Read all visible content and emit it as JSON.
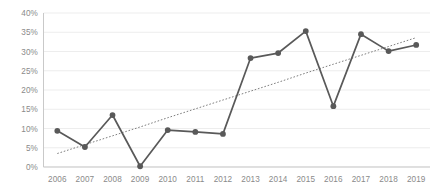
{
  "chart_data": {
    "type": "line",
    "title": "",
    "xlabel": "",
    "ylabel": "",
    "categories": [
      "2006",
      "2007",
      "2008",
      "2009",
      "2010",
      "2011",
      "2012",
      "2013",
      "2014",
      "2015",
      "2016",
      "2017",
      "2018",
      "2019"
    ],
    "values": [
      9.4,
      5.2,
      13.5,
      0.2,
      9.6,
      9.1,
      8.6,
      28.3,
      29.6,
      35.3,
      15.8,
      34.5,
      30.1,
      31.7
    ],
    "series": [
      {
        "name": "series-1",
        "values": [
          9.4,
          5.2,
          13.5,
          0.2,
          9.6,
          9.1,
          8.6,
          28.3,
          29.6,
          35.3,
          15.8,
          34.5,
          30.1,
          31.7
        ],
        "color": "#595959",
        "marker": "circle",
        "style": "solid"
      },
      {
        "name": "trendline",
        "values": [
          3.5,
          5.8,
          8.1,
          10.4,
          12.8,
          15.1,
          17.4,
          19.7,
          22.0,
          24.4,
          26.7,
          29.0,
          31.3,
          33.6
        ],
        "color": "#6f6f6f",
        "marker": "none",
        "style": "dotted"
      }
    ],
    "ylim": [
      0,
      40
    ],
    "ytick_values": [
      0,
      5,
      10,
      15,
      20,
      25,
      30,
      35,
      40
    ],
    "ytick_labels": [
      "0%",
      "5%",
      "10%",
      "15%",
      "20%",
      "25%",
      "30%",
      "35%",
      "40%"
    ],
    "xtick_labels": [
      "2006",
      "2007",
      "2008",
      "2009",
      "2010",
      "2011",
      "2012",
      "2013",
      "2014",
      "2015",
      "2016",
      "2017",
      "2018",
      "2019"
    ],
    "grid": true,
    "grid_axis": "y",
    "legend": false,
    "legend_position": "none",
    "annotations": [],
    "colors": {
      "series": "#595959",
      "trendline": "#6f6f6f",
      "gridline": "#e8e8e8",
      "axis": "#c9c9c9",
      "tick_text": "#8a8a8a",
      "background": "#ffffff"
    }
  }
}
